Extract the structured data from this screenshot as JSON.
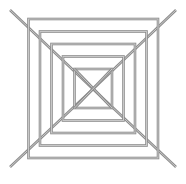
{
  "figure": {
    "canvas": {
      "width": 186,
      "height": 184,
      "background": "#ffffff"
    },
    "style": {
      "line_color": "#8c8c8c",
      "line_highlight": "#c8c8c8",
      "rod_width": 2.6,
      "core_width": 1.0
    },
    "center": {
      "x": 93,
      "y": 89
    },
    "squares": [
      {
        "name": "square-1-outer",
        "left": 28.5,
        "top": 19.0,
        "right": 158.0,
        "bottom": 158.0
      },
      {
        "name": "square-2",
        "left": 40.0,
        "top": 31.5,
        "right": 146.5,
        "bottom": 145.5
      },
      {
        "name": "square-3",
        "left": 51.5,
        "top": 44.0,
        "right": 135.0,
        "bottom": 133.0
      },
      {
        "name": "square-4",
        "left": 63.0,
        "top": 56.5,
        "right": 123.5,
        "bottom": 120.5
      },
      {
        "name": "square-5-inner",
        "left": 74.5,
        "top": 69.0,
        "right": 112.0,
        "bottom": 108.0
      }
    ],
    "diagonals": [
      {
        "name": "diagonal-top-left-to-center",
        "x1": 10.0,
        "y1": 10.0,
        "x2": 93.0,
        "y2": 89.0
      },
      {
        "name": "diagonal-top-right-to-center",
        "x1": 176.0,
        "y1": 10.0,
        "x2": 93.0,
        "y2": 89.0
      },
      {
        "name": "diagonal-bottom-left-to-center",
        "x1": 10.0,
        "y1": 167.0,
        "x2": 93.0,
        "y2": 89.0
      },
      {
        "name": "diagonal-bottom-right-to-center",
        "x1": 176.0,
        "y1": 167.0,
        "x2": 93.0,
        "y2": 89.0
      }
    ],
    "inner_cross": [
      {
        "name": "inner-cross-nw-se",
        "x1": 74.5,
        "y1": 69.0,
        "x2": 112.0,
        "y2": 108.0
      },
      {
        "name": "inner-cross-ne-sw",
        "x1": 112.0,
        "y1": 69.0,
        "x2": 74.5,
        "y2": 108.0
      }
    ]
  }
}
